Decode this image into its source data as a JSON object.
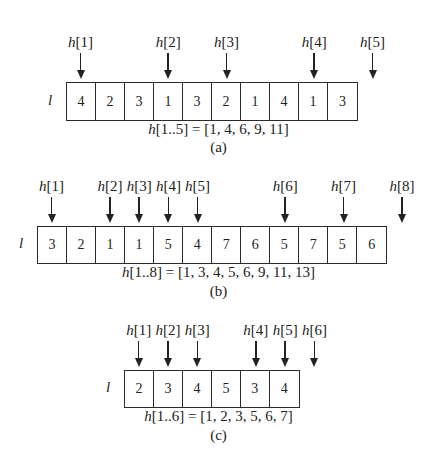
{
  "diagram": {
    "row_label": "l",
    "panels": [
      {
        "id": "a",
        "caption": "(a)",
        "formula": "h[1..5] = [1, 4, 6, 9, 11]",
        "cells": [
          "4",
          "2",
          "3",
          "1",
          "3",
          "2",
          "1",
          "4",
          "1",
          "3"
        ],
        "pointers": [
          {
            "label": "h[1]",
            "cell_index": 0
          },
          {
            "label": "h[2]",
            "cell_index": 3
          },
          {
            "label": "h[3]",
            "cell_index": 5
          },
          {
            "label": "h[4]",
            "cell_index": 8
          },
          {
            "label": "h[5]",
            "cell_index": 10
          }
        ]
      },
      {
        "id": "b",
        "caption": "(b)",
        "formula": "h[1..8] = [1, 3, 4, 5, 6, 9, 11, 13]",
        "cells": [
          "3",
          "2",
          "1",
          "1",
          "5",
          "4",
          "7",
          "6",
          "5",
          "7",
          "5",
          "6"
        ],
        "pointers": [
          {
            "label": "h[1]",
            "cell_index": 0
          },
          {
            "label": "h[2]",
            "cell_index": 2
          },
          {
            "label": "h[3]",
            "cell_index": 3
          },
          {
            "label": "h[4]",
            "cell_index": 4
          },
          {
            "label": "h[5]",
            "cell_index": 5
          },
          {
            "label": "h[6]",
            "cell_index": 8
          },
          {
            "label": "h[7]",
            "cell_index": 10
          },
          {
            "label": "h[8]",
            "cell_index": 12
          }
        ]
      },
      {
        "id": "c",
        "caption": "(c)",
        "formula": "h[1..6] = [1, 2, 3, 5, 6, 7]",
        "cells": [
          "2",
          "3",
          "4",
          "5",
          "3",
          "4"
        ],
        "pointers": [
          {
            "label": "h[1]",
            "cell_index": 0
          },
          {
            "label": "h[2]",
            "cell_index": 1
          },
          {
            "label": "h[3]",
            "cell_index": 2
          },
          {
            "label": "h[4]",
            "cell_index": 4
          },
          {
            "label": "h[5]",
            "cell_index": 5
          },
          {
            "label": "h[6]",
            "cell_index": 6
          }
        ]
      }
    ]
  }
}
